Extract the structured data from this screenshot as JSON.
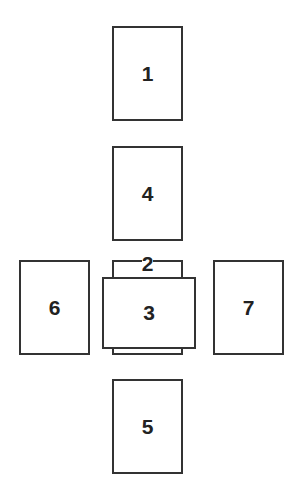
{
  "diagram": {
    "type": "card-spread-layout",
    "cards": [
      {
        "id": 1,
        "label": "1",
        "orientation": "vertical",
        "position": "top"
      },
      {
        "id": 2,
        "label": "2",
        "orientation": "vertical",
        "position": "center-behind"
      },
      {
        "id": 3,
        "label": "3",
        "orientation": "horizontal",
        "position": "center-crossing"
      },
      {
        "id": 4,
        "label": "4",
        "orientation": "vertical",
        "position": "upper-middle"
      },
      {
        "id": 5,
        "label": "5",
        "orientation": "vertical",
        "position": "bottom"
      },
      {
        "id": 6,
        "label": "6",
        "orientation": "vertical",
        "position": "left"
      },
      {
        "id": 7,
        "label": "7",
        "orientation": "vertical",
        "position": "right"
      }
    ],
    "colors": {
      "border": "#333333",
      "fill": "#ffffff",
      "text": "#222222",
      "background": "#ffffff"
    }
  }
}
